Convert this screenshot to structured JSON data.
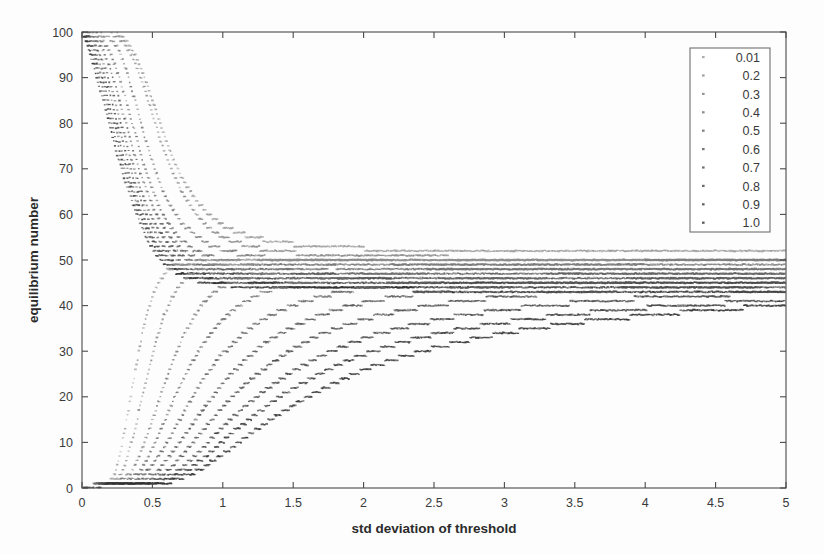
{
  "chart_data": {
    "type": "scatter",
    "title": "",
    "xlabel": "std deviation of threshold",
    "ylabel": "equilibrium number",
    "xlim": [
      0,
      5
    ],
    "ylim": [
      0,
      100
    ],
    "xticks": [
      0,
      0.5,
      1,
      1.5,
      2,
      2.5,
      3,
      3.5,
      4,
      4.5,
      5
    ],
    "xticklabels": [
      "0",
      "0.5",
      "1",
      "1.5",
      "2",
      "2.5",
      "3",
      "3.5",
      "4",
      "4.5",
      "5"
    ],
    "yticks": [
      0,
      10,
      20,
      30,
      40,
      50,
      60,
      70,
      80,
      90,
      100
    ],
    "yticklabels": [
      "0",
      "10",
      "20",
      "30",
      "40",
      "50",
      "60",
      "70",
      "80",
      "90",
      "100"
    ],
    "grid": false,
    "legend_position": "top-right",
    "legend_title": "",
    "marker": "dot",
    "background": "#fdfdfd",
    "legend_entries": [
      "0.01",
      "0.2",
      "0.3",
      "0.4",
      "0.5",
      "0.6",
      "0.7",
      "0.8",
      "0.9",
      "1.0"
    ],
    "series": [
      {
        "name": "0.01",
        "label": "0.01",
        "color": "#9a9a9a",
        "branch": "upper",
        "x": [
          0.0,
          0.1,
          0.2,
          0.25,
          0.3,
          0.35,
          0.4,
          0.45,
          0.5,
          0.55,
          0.6,
          0.65,
          0.7,
          0.8,
          0.9,
          1.0,
          1.2,
          1.4,
          1.6,
          1.8,
          2.0,
          2.3,
          2.6,
          3.0,
          3.4,
          3.8,
          4.2,
          4.6,
          5.0
        ],
        "values": [
          100,
          100,
          100,
          99.5,
          98.5,
          96.5,
          93.5,
          89.5,
          85.0,
          80.5,
          76.0,
          72.0,
          68.5,
          63.5,
          60.0,
          57.5,
          55.0,
          53.8,
          53.2,
          52.8,
          52.5,
          52.3,
          52.2,
          52.1,
          52.1,
          52.0,
          52.0,
          52.0,
          52.0
        ]
      },
      {
        "name": "0.2",
        "label": "0.2",
        "color": "#8a8a8a",
        "branch": "upper",
        "x": [
          0.0,
          0.1,
          0.2,
          0.25,
          0.3,
          0.35,
          0.4,
          0.45,
          0.5,
          0.55,
          0.6,
          0.7,
          0.8,
          0.9,
          1.0,
          1.2,
          1.4,
          1.6,
          1.8,
          2.0,
          2.3,
          2.6,
          3.0,
          3.4,
          3.8,
          4.2,
          4.6,
          5.0
        ],
        "values": [
          100,
          100,
          99.8,
          99.0,
          97.5,
          95.0,
          91.5,
          87.0,
          82.0,
          77.0,
          72.5,
          65.5,
          60.5,
          57.0,
          55.0,
          52.8,
          51.8,
          51.3,
          51.0,
          50.8,
          50.6,
          50.5,
          50.4,
          50.4,
          50.3,
          50.3,
          50.3,
          50.3
        ]
      },
      {
        "name": "0.3",
        "label": "0.3",
        "color": "#7a7a7a",
        "branch": "upper",
        "x": [
          0.0,
          0.1,
          0.18,
          0.22,
          0.26,
          0.3,
          0.34,
          0.38,
          0.42,
          0.46,
          0.5,
          0.55,
          0.6,
          0.7,
          0.8,
          0.9,
          1.0,
          1.2,
          1.4,
          1.6,
          1.9,
          2.2,
          2.6,
          3.0,
          3.5,
          4.0,
          4.5,
          5.0
        ],
        "values": [
          100,
          99.8,
          99.0,
          98.0,
          96.0,
          93.0,
          89.0,
          84.5,
          80.0,
          75.5,
          71.5,
          67.0,
          63.5,
          58.5,
          55.5,
          53.5,
          52.2,
          50.8,
          50.2,
          49.9,
          49.6,
          49.5,
          49.4,
          49.3,
          49.3,
          49.2,
          49.2,
          49.2
        ]
      },
      {
        "name": "0.4",
        "label": "0.4",
        "color": "#6f6f6f",
        "branch": "upper",
        "x": [
          0.0,
          0.08,
          0.14,
          0.18,
          0.22,
          0.26,
          0.3,
          0.34,
          0.38,
          0.42,
          0.46,
          0.5,
          0.55,
          0.6,
          0.7,
          0.8,
          0.9,
          1.0,
          1.2,
          1.5,
          1.8,
          2.2,
          2.6,
          3.0,
          3.5,
          4.0,
          4.5,
          5.0
        ],
        "values": [
          100,
          99.5,
          98.2,
          96.5,
          94.0,
          90.5,
          86.5,
          82.0,
          77.5,
          73.0,
          69.0,
          65.5,
          61.5,
          58.5,
          54.5,
          52.2,
          50.8,
          50.0,
          49.2,
          48.7,
          48.5,
          48.4,
          48.3,
          48.3,
          48.2,
          48.2,
          48.2,
          48.2
        ]
      },
      {
        "name": "0.5",
        "label": "0.5",
        "color": "#636363",
        "branch": "upper",
        "x": [
          0.0,
          0.06,
          0.12,
          0.16,
          0.2,
          0.24,
          0.28,
          0.32,
          0.36,
          0.4,
          0.45,
          0.5,
          0.55,
          0.6,
          0.7,
          0.8,
          0.9,
          1.0,
          1.2,
          1.5,
          1.9,
          2.4,
          2.9,
          3.4,
          4.0,
          4.5,
          5.0
        ],
        "values": [
          100,
          99.2,
          97.5,
          95.2,
          92.0,
          88.0,
          83.5,
          79.0,
          74.5,
          70.5,
          66.0,
          62.0,
          58.8,
          56.0,
          52.5,
          50.5,
          49.3,
          48.6,
          47.9,
          47.5,
          47.3,
          47.2,
          47.1,
          47.1,
          47.0,
          47.0,
          47.0
        ]
      },
      {
        "name": "0.6",
        "label": "0.6",
        "color": "#585858",
        "branch": "upper",
        "x": [
          0.0,
          0.05,
          0.1,
          0.14,
          0.18,
          0.22,
          0.26,
          0.3,
          0.34,
          0.38,
          0.42,
          0.48,
          0.54,
          0.6,
          0.7,
          0.8,
          0.9,
          1.0,
          1.25,
          1.6,
          2.0,
          2.5,
          3.0,
          3.6,
          4.2,
          4.7,
          5.0
        ],
        "values": [
          100,
          99.0,
          96.8,
          94.2,
          90.8,
          86.5,
          82.0,
          77.5,
          73.0,
          69.0,
          65.2,
          60.5,
          56.8,
          54.0,
          51.0,
          49.3,
          48.3,
          47.7,
          47.0,
          46.6,
          46.4,
          46.3,
          46.2,
          46.2,
          46.1,
          46.1,
          46.1
        ]
      },
      {
        "name": "0.7",
        "label": "0.7",
        "color": "#4e4e4e",
        "branch": "upper",
        "x": [
          0.0,
          0.04,
          0.09,
          0.13,
          0.17,
          0.21,
          0.25,
          0.29,
          0.33,
          0.37,
          0.42,
          0.48,
          0.54,
          0.6,
          0.7,
          0.8,
          0.9,
          1.0,
          1.3,
          1.7,
          2.2,
          2.8,
          3.4,
          4.0,
          4.6,
          5.0
        ],
        "values": [
          100,
          98.8,
          96.0,
          93.0,
          89.2,
          85.0,
          80.2,
          75.8,
          71.5,
          67.5,
          63.0,
          58.2,
          54.8,
          52.2,
          49.5,
          48.0,
          47.2,
          46.7,
          46.0,
          45.7,
          45.5,
          45.4,
          45.4,
          45.3,
          45.3,
          45.3
        ]
      },
      {
        "name": "0.8",
        "label": "0.8",
        "color": "#454545",
        "branch": "upper",
        "x": [
          0.0,
          0.04,
          0.08,
          0.12,
          0.16,
          0.2,
          0.24,
          0.28,
          0.32,
          0.36,
          0.41,
          0.47,
          0.53,
          0.6,
          0.7,
          0.8,
          0.9,
          1.0,
          1.35,
          1.8,
          2.4,
          3.0,
          3.7,
          4.4,
          5.0
        ],
        "values": [
          100,
          98.5,
          95.5,
          92.2,
          88.2,
          83.5,
          78.8,
          74.2,
          70.0,
          66.0,
          61.5,
          57.0,
          53.5,
          50.8,
          48.3,
          47.0,
          46.3,
          45.8,
          45.2,
          44.9,
          44.7,
          44.6,
          44.6,
          44.5,
          44.5
        ]
      },
      {
        "name": "0.9",
        "label": "0.9",
        "color": "#3c3c3c",
        "branch": "upper",
        "x": [
          0.0,
          0.03,
          0.07,
          0.11,
          0.15,
          0.19,
          0.23,
          0.27,
          0.31,
          0.36,
          0.41,
          0.47,
          0.53,
          0.6,
          0.7,
          0.8,
          0.9,
          1.05,
          1.4,
          1.9,
          2.5,
          3.2,
          4.0,
          4.6,
          5.0
        ],
        "values": [
          100,
          98.2,
          95.0,
          91.5,
          87.2,
          82.5,
          77.8,
          73.2,
          69.0,
          64.5,
          60.2,
          55.8,
          52.5,
          49.8,
          47.5,
          46.3,
          45.6,
          45.1,
          44.5,
          44.2,
          44.0,
          43.9,
          43.9,
          43.8,
          43.8
        ]
      },
      {
        "name": "1.0",
        "label": "1.0",
        "color": "#303030",
        "branch": "upper",
        "x": [
          0.0,
          0.03,
          0.06,
          0.1,
          0.14,
          0.18,
          0.22,
          0.26,
          0.3,
          0.35,
          0.4,
          0.46,
          0.52,
          0.6,
          0.7,
          0.8,
          0.92,
          1.1,
          1.5,
          2.0,
          2.7,
          3.4,
          4.2,
          5.0
        ],
        "values": [
          100,
          98.0,
          94.5,
          90.8,
          86.2,
          81.5,
          76.8,
          72.2,
          68.0,
          63.5,
          59.2,
          54.8,
          51.5,
          48.8,
          46.8,
          45.6,
          44.9,
          44.4,
          43.9,
          43.6,
          43.4,
          43.3,
          43.3,
          43.2
        ]
      },
      {
        "name": "0.01-lower",
        "label": "0.01",
        "color": "#9a9a9a",
        "branch": "lower",
        "x": [
          0.0,
          0.15,
          0.22,
          0.26,
          0.3,
          0.34,
          0.38,
          0.42,
          0.46,
          0.5,
          0.55,
          0.6,
          0.65,
          0.7,
          0.8,
          0.9,
          1.0,
          1.2,
          1.5,
          2.0,
          2.6,
          3.2,
          4.0,
          4.6,
          5.0
        ],
        "values": [
          0.3,
          0.6,
          2.0,
          6.0,
          12.0,
          19.0,
          26.0,
          32.5,
          38.0,
          42.0,
          45.5,
          47.5,
          48.5,
          49.0,
          49.5,
          49.7,
          49.8,
          49.9,
          50.0,
          50.0,
          50.0,
          50.0,
          50.0,
          50.0,
          50.0
        ]
      },
      {
        "name": "0.2-lower",
        "label": "0.2",
        "color": "#8a8a8a",
        "branch": "lower",
        "x": [
          0.0,
          0.2,
          0.28,
          0.33,
          0.38,
          0.43,
          0.48,
          0.53,
          0.58,
          0.64,
          0.7,
          0.76,
          0.84,
          0.92,
          1.0,
          1.15,
          1.35,
          1.6,
          2.0,
          2.5,
          3.1,
          3.8,
          4.5,
          5.0
        ],
        "values": [
          0.3,
          0.8,
          3.0,
          7.5,
          13.5,
          20.0,
          26.5,
          32.5,
          37.5,
          41.8,
          44.8,
          46.8,
          48.2,
          48.8,
          49.1,
          49.4,
          49.6,
          49.7,
          49.8,
          49.8,
          49.9,
          49.9,
          49.9,
          49.9
        ]
      },
      {
        "name": "0.3-lower",
        "label": "0.3",
        "color": "#7a7a7a",
        "branch": "lower",
        "x": [
          0.0,
          0.25,
          0.35,
          0.42,
          0.49,
          0.56,
          0.63,
          0.7,
          0.78,
          0.86,
          0.95,
          1.05,
          1.15,
          1.3,
          1.5,
          1.8,
          2.2,
          2.7,
          3.3,
          4.0,
          4.5,
          5.0
        ],
        "values": [
          0.3,
          0.9,
          3.5,
          8.0,
          14.0,
          20.5,
          26.5,
          32.0,
          36.8,
          40.5,
          43.2,
          45.0,
          46.2,
          47.2,
          48.0,
          48.6,
          49.0,
          49.2,
          49.4,
          49.5,
          49.5,
          49.5
        ]
      },
      {
        "name": "0.4-lower",
        "label": "0.4",
        "color": "#6f6f6f",
        "branch": "lower",
        "x": [
          0.0,
          0.3,
          0.42,
          0.5,
          0.58,
          0.66,
          0.75,
          0.84,
          0.94,
          1.04,
          1.15,
          1.28,
          1.42,
          1.6,
          1.85,
          2.2,
          2.6,
          3.1,
          3.7,
          4.3,
          5.0
        ],
        "values": [
          0.3,
          1.0,
          3.8,
          8.5,
          14.2,
          20.2,
          25.8,
          30.8,
          35.0,
          38.2,
          40.8,
          42.8,
          44.2,
          45.4,
          46.4,
          47.2,
          47.7,
          48.0,
          48.3,
          48.4,
          48.5
        ]
      },
      {
        "name": "0.5-lower",
        "label": "0.5",
        "color": "#636363",
        "branch": "lower",
        "x": [
          0.0,
          0.35,
          0.48,
          0.58,
          0.68,
          0.78,
          0.88,
          1.0,
          1.12,
          1.25,
          1.4,
          1.56,
          1.75,
          1.98,
          2.25,
          2.6,
          3.0,
          3.5,
          4.1,
          4.6,
          5.0
        ],
        "values": [
          0.3,
          1.0,
          4.0,
          8.8,
          14.2,
          19.8,
          24.8,
          29.5,
          33.2,
          36.3,
          38.8,
          40.8,
          42.4,
          43.8,
          44.8,
          45.6,
          46.2,
          46.7,
          47.0,
          47.2,
          47.3
        ]
      },
      {
        "name": "0.6-lower",
        "label": "0.6",
        "color": "#585858",
        "branch": "lower",
        "x": [
          0.0,
          0.4,
          0.55,
          0.66,
          0.78,
          0.9,
          1.02,
          1.16,
          1.3,
          1.46,
          1.64,
          1.84,
          2.06,
          2.32,
          2.62,
          3.0,
          3.4,
          3.9,
          4.4,
          5.0
        ],
        "values": [
          0.3,
          1.0,
          4.0,
          8.5,
          13.8,
          19.0,
          23.8,
          28.2,
          31.8,
          34.8,
          37.3,
          39.4,
          41.0,
          42.4,
          43.5,
          44.4,
          45.0,
          45.5,
          45.8,
          46.1
        ]
      },
      {
        "name": "0.7-lower",
        "label": "0.7",
        "color": "#4e4e4e",
        "branch": "lower",
        "x": [
          0.0,
          0.45,
          0.62,
          0.75,
          0.88,
          1.02,
          1.16,
          1.32,
          1.48,
          1.66,
          1.86,
          2.08,
          2.34,
          2.62,
          2.95,
          3.35,
          3.8,
          4.3,
          4.8,
          5.0
        ],
        "values": [
          0.3,
          1.0,
          4.0,
          8.5,
          13.5,
          18.5,
          22.8,
          26.8,
          30.2,
          33.2,
          35.6,
          37.6,
          39.3,
          40.6,
          41.8,
          42.8,
          43.5,
          44.1,
          44.5,
          44.6
        ]
      },
      {
        "name": "0.8-lower",
        "label": "0.8",
        "color": "#454545",
        "branch": "lower",
        "x": [
          0.0,
          0.5,
          0.7,
          0.84,
          0.98,
          1.14,
          1.3,
          1.48,
          1.66,
          1.86,
          2.08,
          2.34,
          2.62,
          2.94,
          3.3,
          3.7,
          4.15,
          4.6,
          5.0
        ],
        "values": [
          0.3,
          1.0,
          4.0,
          8.2,
          12.8,
          17.5,
          21.5,
          25.2,
          28.4,
          31.2,
          33.6,
          35.7,
          37.4,
          38.9,
          40.1,
          41.1,
          41.9,
          42.5,
          42.9
        ]
      },
      {
        "name": "0.9-lower",
        "label": "0.9",
        "color": "#3c3c3c",
        "branch": "lower",
        "x": [
          0.0,
          0.55,
          0.76,
          0.92,
          1.08,
          1.26,
          1.44,
          1.64,
          1.84,
          2.06,
          2.32,
          2.6,
          2.92,
          3.26,
          3.64,
          4.05,
          4.5,
          5.0
        ],
        "values": [
          0.3,
          1.0,
          4.0,
          8.0,
          12.5,
          16.8,
          20.8,
          24.2,
          27.4,
          30.0,
          32.4,
          34.3,
          36.0,
          37.4,
          38.6,
          39.6,
          40.4,
          41.1
        ]
      },
      {
        "name": "1.0-lower",
        "label": "1.0",
        "color": "#303030",
        "branch": "lower",
        "x": [
          0.0,
          0.6,
          0.84,
          1.02,
          1.2,
          1.4,
          1.6,
          1.82,
          2.04,
          2.3,
          2.56,
          2.86,
          3.18,
          3.54,
          3.92,
          4.32,
          4.7,
          5.0
        ],
        "values": [
          0.3,
          1.0,
          4.0,
          7.8,
          12.0,
          16.2,
          20.0,
          23.4,
          26.4,
          29.0,
          31.2,
          33.2,
          34.9,
          36.4,
          37.6,
          38.7,
          39.5,
          40.0
        ]
      }
    ]
  }
}
